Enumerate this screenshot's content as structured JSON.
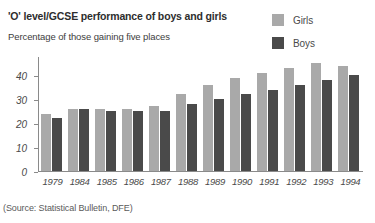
{
  "chart_data": {
    "type": "bar",
    "title": "'O' level/GCSE performance of boys and girls",
    "subtitle": "Percentage of those gaining five places",
    "xlabel": "",
    "ylabel": "",
    "ylim": [
      0,
      48
    ],
    "yticks": [
      0,
      10,
      20,
      30,
      40
    ],
    "ytick_labels": [
      "0",
      "10",
      "20",
      "30",
      "40"
    ],
    "grid": false,
    "legend_position": "top-right",
    "categories": [
      "1979",
      "1984",
      "1985",
      "1986",
      "1987",
      "1988",
      "1989",
      "1990",
      "1991",
      "1992",
      "1993",
      "1994"
    ],
    "series": [
      {
        "name": "Girls",
        "color": "#a9a9a9",
        "values": [
          24,
          26,
          26,
          26,
          27,
          32,
          36,
          39,
          41,
          43,
          45,
          44
        ]
      },
      {
        "name": "Boys",
        "color": "#4a4a4a",
        "values": [
          22,
          26,
          25,
          25,
          25,
          28,
          30,
          32,
          34,
          36,
          38,
          40
        ]
      }
    ],
    "source": "(Source: Statistical Bulletin, DFE)"
  }
}
